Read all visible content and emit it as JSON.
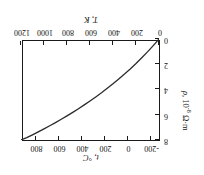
{
  "figure": {
    "background": "#ffffff",
    "line_color": "#2b2b2b",
    "axis_color": "#1a1a1a",
    "rotation_degrees": 180
  },
  "chart_data": {
    "type": "line",
    "title": "",
    "xlabel": "T, K",
    "ylabel": "ρ, 10⁻⁸ Ω·m",
    "secondary_xlabel": "t, °C",
    "xlim": [
      0,
      1200
    ],
    "ylim": [
      0,
      8
    ],
    "secondary_xlim": [
      -273,
      927
    ],
    "grid": false,
    "legend": null,
    "xticks": [
      0,
      200,
      400,
      600,
      800,
      1000,
      1200
    ],
    "xticklabels": [
      "0",
      "200",
      "400",
      "600",
      "800",
      "1000",
      "1200"
    ],
    "yticks": [
      0,
      2,
      4,
      6,
      8
    ],
    "yticklabels": [
      "0",
      "2",
      "4",
      "6",
      "8"
    ],
    "secondary_xticks": [
      -200,
      0,
      200,
      400,
      600,
      800
    ],
    "secondary_xticklabels": [
      "-200",
      "0",
      "200",
      "400",
      "600",
      "800"
    ],
    "series": [
      {
        "name": "resistivity",
        "x": [
          0,
          50,
          100,
          150,
          200,
          250,
          300,
          350,
          400,
          450,
          500,
          550,
          600,
          650,
          700,
          750,
          800,
          850,
          900,
          950,
          1000,
          1050,
          1100,
          1150,
          1200
        ],
        "y": [
          0.0,
          0.52,
          1.02,
          1.49,
          1.94,
          2.37,
          2.78,
          3.17,
          3.55,
          3.91,
          4.26,
          4.59,
          4.91,
          5.22,
          5.52,
          5.81,
          6.09,
          6.36,
          6.62,
          6.87,
          7.12,
          7.36,
          7.59,
          7.81,
          8.0
        ]
      }
    ]
  },
  "axes": {
    "bottom_title": "T, K",
    "top_title": "t, °C",
    "left_title_rho": "ρ",
    "left_title_rest": ", 10",
    "left_title_exp": "-8",
    "left_title_units": " Ω·m"
  }
}
